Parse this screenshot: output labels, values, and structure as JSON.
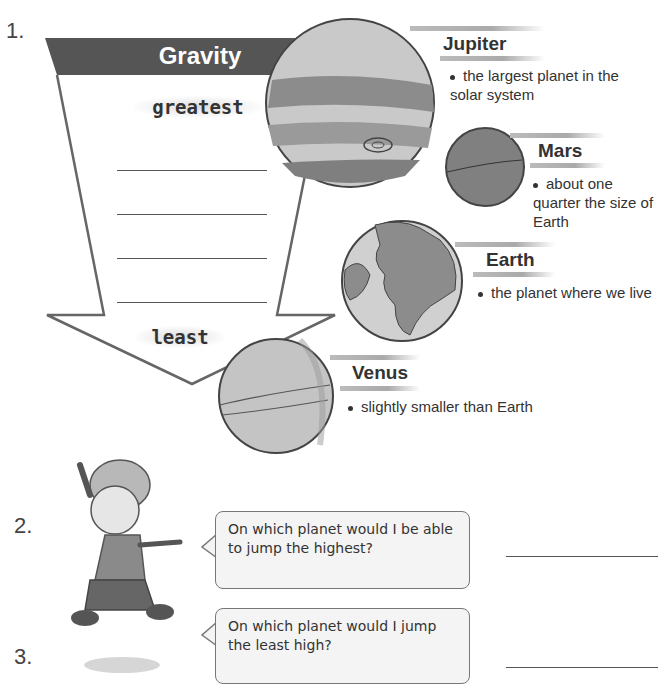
{
  "question1": {
    "number": "1.",
    "chart_title": "Gravity",
    "top_label": "greatest",
    "bottom_label": "least",
    "blank_count": 4,
    "planets": [
      {
        "name": "Jupiter",
        "description": "the largest planet in the solar system"
      },
      {
        "name": "Mars",
        "description": "about one quarter the size of Earth"
      },
      {
        "name": "Earth",
        "description": "the planet where we live"
      },
      {
        "name": "Venus",
        "description": "slightly smaller than Earth"
      }
    ]
  },
  "question2": {
    "number": "2.",
    "bubble_text": "On which planet would I be able to jump the highest?"
  },
  "question3": {
    "number": "3.",
    "bubble_text": "On which planet would I jump the least high?"
  },
  "colors": {
    "header": "#555555",
    "arrow_stroke": "#666666",
    "planet_light": "#c8c8c8",
    "planet_dark": "#8a8a8a"
  }
}
